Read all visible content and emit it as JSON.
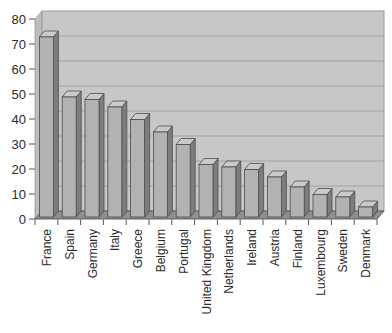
{
  "chart_data": {
    "type": "bar",
    "style": "3d-column-grayscale",
    "title": "",
    "xlabel": "",
    "ylabel": "",
    "categories": [
      "France",
      "Spain",
      "Germany",
      "Italy",
      "Greece",
      "Belgium",
      "Portugal",
      "United Kingdom",
      "Netherlands",
      "Ireland",
      "Austria",
      "Finland",
      "Luxembourg",
      "Sweden",
      "Denmark"
    ],
    "values": [
      72,
      48,
      47,
      44,
      39,
      34,
      29,
      21,
      20,
      19,
      16,
      12,
      9,
      8,
      4
    ],
    "ylim": [
      0,
      80
    ],
    "ytick_step": 10,
    "yticks": [
      0,
      10,
      20,
      30,
      40,
      50,
      60,
      70,
      80
    ],
    "grid": true,
    "legend": false,
    "x_label_rotation": 90
  },
  "colors": {
    "background": "#ffffff",
    "wall": "#c7c7c7",
    "side_wall": "#bdbdbd",
    "wall_border": "#9a9a9a",
    "gridline": "#a2a2a2",
    "floor": "#8f8f8f",
    "floor_border": "#5c5c5c",
    "bar_front": "#b2b2b2",
    "bar_top": "#cacaca",
    "bar_side": "#7d7d7d",
    "bar_outline": "#4d4d4d",
    "tick": "#555555",
    "axis_text": "#2b2b2b"
  }
}
